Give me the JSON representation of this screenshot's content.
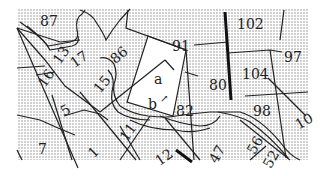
{
  "map": {
    "colors": {
      "background": "#ffffff",
      "stipple": "#8a8a8a",
      "border": "#222222",
      "highlight_fill": "#ffffff"
    },
    "labels": [
      {
        "id": "87",
        "text": "87",
        "x": 40,
        "y": 14,
        "rot": 0
      },
      {
        "id": "102",
        "text": "102",
        "x": 237,
        "y": 17,
        "rot": 0
      },
      {
        "id": "97",
        "text": "97",
        "x": 284,
        "y": 50,
        "rot": 0
      },
      {
        "id": "91",
        "text": "91",
        "x": 172,
        "y": 39,
        "rot": 0
      },
      {
        "id": "16",
        "text": "16",
        "x": 37,
        "y": 71,
        "rot": -55
      },
      {
        "id": "13",
        "text": "13",
        "x": 52,
        "y": 48,
        "rot": -55
      },
      {
        "id": "17",
        "text": "17",
        "x": 70,
        "y": 52,
        "rot": -35
      },
      {
        "id": "86",
        "text": "86",
        "x": 110,
        "y": 48,
        "rot": -40
      },
      {
        "id": "a",
        "text": "a",
        "x": 154,
        "y": 72,
        "rot": 0
      },
      {
        "id": "b",
        "text": "b",
        "x": 148,
        "y": 97,
        "rot": 0
      },
      {
        "id": "80",
        "text": "80",
        "x": 209,
        "y": 78,
        "rot": 0
      },
      {
        "id": "104",
        "text": "104",
        "x": 242,
        "y": 67,
        "rot": 0
      },
      {
        "id": "15",
        "text": "15",
        "x": 93,
        "y": 77,
        "rot": -50
      },
      {
        "id": "5",
        "text": "5",
        "x": 61,
        "y": 103,
        "rot": -30
      },
      {
        "id": "82",
        "text": "82",
        "x": 176,
        "y": 104,
        "rot": 0
      },
      {
        "id": "98",
        "text": "98",
        "x": 253,
        "y": 104,
        "rot": 0
      },
      {
        "id": "10",
        "text": "10",
        "x": 295,
        "y": 114,
        "rot": -30
      },
      {
        "id": "11",
        "text": "11",
        "x": 119,
        "y": 125,
        "rot": -55
      },
      {
        "id": "7",
        "text": "7",
        "x": 38,
        "y": 142,
        "rot": 0
      },
      {
        "id": "1",
        "text": "1",
        "x": 89,
        "y": 145,
        "rot": -45
      },
      {
        "id": "12",
        "text": "12",
        "x": 155,
        "y": 150,
        "rot": -35
      },
      {
        "id": "47",
        "text": "47",
        "x": 208,
        "y": 147,
        "rot": -60
      },
      {
        "id": "56",
        "text": "56",
        "x": 246,
        "y": 138,
        "rot": -60
      },
      {
        "id": "52",
        "text": "52",
        "x": 262,
        "y": 152,
        "rot": -60
      }
    ],
    "arrow_marker": {
      "x": 160,
      "y": 94
    }
  }
}
